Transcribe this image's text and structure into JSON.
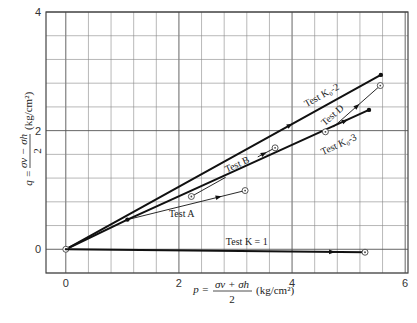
{
  "chart_data": {
    "type": "line",
    "title": "",
    "xlabel": "p = (σv + σh)/2 (kg/cm²)",
    "ylabel": "q = (σv − σh)/2 (kg/cm²)",
    "xlabel_parts": {
      "lhs": "p =",
      "num": "σv + σh",
      "den": "2",
      "unit": "(kg/cm²)"
    },
    "ylabel_parts": {
      "lhs": "q =",
      "num": "σv − σh",
      "den": "2",
      "unit": "(kg/cm²)"
    },
    "xlim": [
      -0.35,
      6.05
    ],
    "ylim": [
      -0.4,
      4.0
    ],
    "x_ticks": [
      0,
      2,
      4,
      6
    ],
    "x_tick_labels": [
      "0",
      "2",
      "4",
      "6"
    ],
    "y_ticks": [
      0,
      2,
      4
    ],
    "y_tick_labels": [
      "0",
      "2",
      "4"
    ],
    "grid": true,
    "grid_step": 0.4,
    "series": [
      {
        "name": "Test K0-2",
        "weight": "thick",
        "points": [
          [
            0,
            0
          ],
          [
            5.57,
            2.94
          ]
        ],
        "markers": [
          {
            "at": [
              5.57,
              2.94
            ],
            "style": "filled"
          }
        ],
        "arrow_at": 0.72
      },
      {
        "name": "Test K0-3",
        "weight": "thick",
        "points": [
          [
            0,
            0
          ],
          [
            1.09,
            0.5
          ],
          [
            5.36,
            2.35
          ]
        ],
        "markers": [
          {
            "at": [
              0,
              0
            ],
            "style": "open"
          },
          {
            "at": [
              1.09,
              0.5
            ],
            "style": "filled"
          },
          {
            "at": [
              4.59,
              1.98
            ],
            "style": "open"
          },
          {
            "at": [
              5.36,
              2.35
            ],
            "style": "filled"
          }
        ],
        "arrow_at": 0.93
      },
      {
        "name": "Test A",
        "weight": "thin",
        "points": [
          [
            1.09,
            0.5
          ],
          [
            3.17,
            0.99
          ]
        ],
        "markers": [
          {
            "at": [
              3.17,
              0.99
            ],
            "style": "open"
          }
        ],
        "arrow_at": 0.8
      },
      {
        "name": "Test B (part 1)",
        "weight": "thin",
        "points": [
          [
            2.22,
            0.89
          ],
          [
            2.82,
            1.21
          ]
        ],
        "markers": [
          {
            "at": [
              2.22,
              0.89
            ],
            "style": "open"
          }
        ],
        "arrow_at": null
      },
      {
        "name": "Test B",
        "weight": "thin",
        "points": [
          [
            3.4,
            1.56
          ],
          [
            3.7,
            1.71
          ]
        ],
        "markers": [
          {
            "at": [
              3.7,
              1.71
            ],
            "style": "open"
          }
        ],
        "arrow_at": 0.5
      },
      {
        "name": "Test D",
        "weight": "thin",
        "points": [
          [
            4.74,
            2.07
          ],
          [
            5.56,
            2.76
          ]
        ],
        "markers": [
          {
            "at": [
              5.56,
              2.76
            ],
            "style": "open"
          }
        ],
        "arrow_at": 0.55
      },
      {
        "name": "Test K=1",
        "weight": "thick",
        "points": [
          [
            0,
            0
          ],
          [
            5.29,
            -0.05
          ]
        ],
        "markers": [
          {
            "at": [
              5.29,
              -0.05
            ],
            "style": "open"
          }
        ],
        "arrow_at": 0.9
      }
    ],
    "annotations": [
      {
        "text": "Test K₀-2",
        "at": [
          4.55,
          2.55
        ],
        "angle_series": "Test K0-2"
      },
      {
        "text": "Test D",
        "at": [
          4.75,
          2.22
        ],
        "angle_series": "Test D"
      },
      {
        "text": "Test K₀-3",
        "at": [
          4.85,
          1.72
        ],
        "angle_series": "Test K0-3"
      },
      {
        "text": "Test B",
        "at": [
          3.05,
          1.38
        ],
        "angle_series": "Test K0-3"
      },
      {
        "text": "Test A",
        "at": [
          2.05,
          0.55
        ],
        "angle_series": null
      },
      {
        "text": "Test K = 1",
        "at": [
          3.2,
          0.07
        ],
        "angle_series": null
      }
    ]
  }
}
